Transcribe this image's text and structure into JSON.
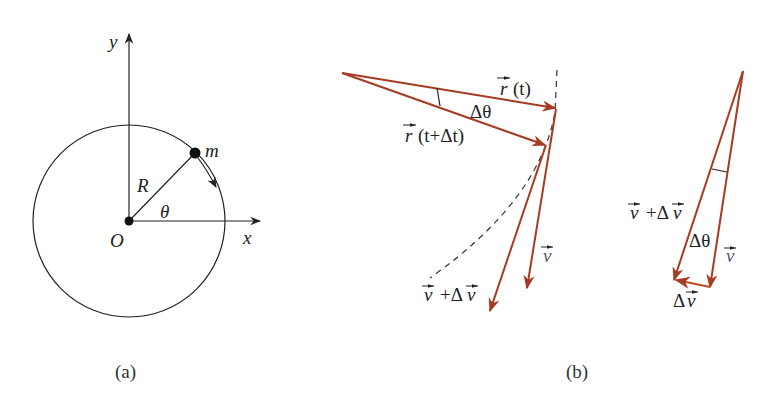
{
  "figure_a": {
    "caption": "(a)",
    "labels": {
      "y_axis": "y",
      "x_axis": "x",
      "origin": "O",
      "radius": "R",
      "angle": "θ",
      "mass": "m"
    }
  },
  "figure_b": {
    "caption": "(b)",
    "left": {
      "r_t": "(t)",
      "r_t_dt": "(t+Δt)",
      "delta_theta": "Δθ",
      "v": "v",
      "v_plus_dv": "v",
      "v_plus_dv_rest": "+Δ",
      "v_plus_dv_tail": "v"
    },
    "right": {
      "v_plus_dv": "v",
      "v_plus_dv_rest": "+Δ",
      "v_plus_dv_tail": "v",
      "delta_theta": "Δθ",
      "v": "v",
      "delta_v_prefix": "Δ",
      "delta_v": "v"
    }
  },
  "colors": {
    "vector": "#a63a22",
    "line": "#222222",
    "dashed": "#333344"
  }
}
